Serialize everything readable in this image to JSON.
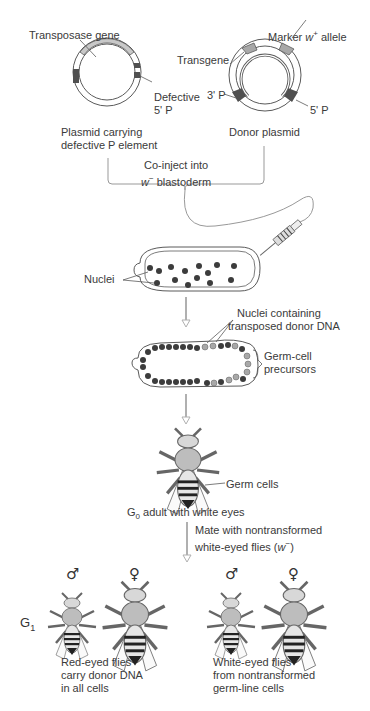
{
  "plasmids": {
    "helper": {
      "gene_label": "Transposase gene",
      "defective_label_1": "Defective",
      "defective_label_2": "5' P",
      "caption_1": "Plasmid carrying",
      "caption_2": "defective P element"
    },
    "donor": {
      "marker_label_prefix": "Marker ",
      "marker_label_gene": "w",
      "marker_label_sup": "+",
      "marker_label_suffix": " allele",
      "transgene_label": "Transgene",
      "p3_label": "3' P",
      "p5_label": "5' P",
      "caption": "Donor plasmid"
    }
  },
  "injection": {
    "label_1": "Co-inject into",
    "label_2_gene": "w",
    "label_2_sup": "−",
    "label_2_rest": " blastoderm"
  },
  "embryo": {
    "nuclei_label": "Nuclei"
  },
  "germ_embryo": {
    "transposed_label_1": "Nuclei containing",
    "transposed_label_2": "transposed donor DNA",
    "precursor_label_1": "Germ-cell",
    "precursor_label_2": "precursors"
  },
  "g0": {
    "germ_cells_label": "Germ cells",
    "caption_prefix": "G",
    "caption_sub": "0",
    "caption_rest": " adult with white eyes"
  },
  "cross": {
    "label_1": "Mate with nontransformed",
    "label_2_prefix": "white-eyed flies (",
    "label_2_gene": "w",
    "label_2_sup": "−",
    "label_2_suffix": ")"
  },
  "g1": {
    "generation_prefix": "G",
    "generation_sub": "1",
    "male_symbol": "♂",
    "female_symbol": "♀",
    "red_eyed": {
      "line_1": "Red-eyed flies",
      "line_2": "carry donor DNA",
      "line_3": "in all cells"
    },
    "white_eyed": {
      "line_1": "White-eyed flies",
      "line_2": "from nontransformed",
      "line_3": "germ-line cells"
    }
  },
  "colors": {
    "line": "#5a5a5a",
    "light_gray": "#c8c8c8",
    "mid_gray": "#a8a8a8",
    "dark_gray": "#505050",
    "nucleus": "#3c3c3c",
    "arrow": "#b0b0b0"
  }
}
